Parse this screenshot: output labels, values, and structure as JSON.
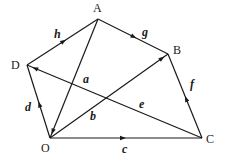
{
  "diagram": {
    "type": "vector-geometry-figure",
    "vertices": [
      {
        "id": "A",
        "label": "A",
        "x": 98,
        "y": 19
      },
      {
        "id": "B",
        "label": "B",
        "x": 168,
        "y": 54
      },
      {
        "id": "C",
        "label": "C",
        "x": 202,
        "y": 138
      },
      {
        "id": "D",
        "label": "D",
        "x": 27,
        "y": 65
      },
      {
        "id": "O",
        "label": "O",
        "x": 50,
        "y": 138
      }
    ],
    "edges": [
      {
        "id": "h",
        "label": "h",
        "from": "D",
        "to": "A",
        "arrow_at": 0.55
      },
      {
        "id": "g",
        "label": "g",
        "from": "A",
        "to": "B",
        "arrow_at": 0.55
      },
      {
        "id": "f",
        "label": "f",
        "from": "C",
        "to": "B",
        "arrow_at": 0.5
      },
      {
        "id": "e",
        "label": "e",
        "from": "C",
        "to": "D",
        "arrow_at": 0.97
      },
      {
        "id": "d",
        "label": "d",
        "from": "O",
        "to": "D",
        "arrow_at": 0.5
      },
      {
        "id": "a",
        "label": "a",
        "from": "A",
        "to": "O",
        "arrow_at": 0.97
      },
      {
        "id": "b",
        "label": "b",
        "from": "O",
        "to": "B",
        "arrow_at": 0.97
      },
      {
        "id": "c",
        "label": "c",
        "from": "O",
        "to": "C",
        "arrow_at": 0.5
      }
    ],
    "vertex_labels": {
      "A": {
        "text": "A",
        "x": 93,
        "y": 12
      },
      "B": {
        "text": "B",
        "x": 173,
        "y": 54
      },
      "C": {
        "text": "C",
        "x": 206,
        "y": 143
      },
      "D": {
        "text": "D",
        "x": 11,
        "y": 69
      },
      "O": {
        "text": "O",
        "x": 41,
        "y": 152
      }
    },
    "edge_labels": {
      "h": {
        "text": "h",
        "x": 54,
        "y": 38
      },
      "g": {
        "text": "g",
        "x": 142,
        "y": 36
      },
      "f": {
        "text": "f",
        "x": 190,
        "y": 88
      },
      "e": {
        "text": "e",
        "x": 139,
        "y": 108
      },
      "d": {
        "text": "d",
        "x": 25,
        "y": 111
      },
      "a": {
        "text": "a",
        "x": 83,
        "y": 83
      },
      "b": {
        "text": "b",
        "x": 90,
        "y": 120
      },
      "c": {
        "text": "c",
        "x": 122,
        "y": 153
      }
    },
    "colors": {
      "stroke": "#1a1a1a",
      "background": "#ffffff"
    }
  }
}
